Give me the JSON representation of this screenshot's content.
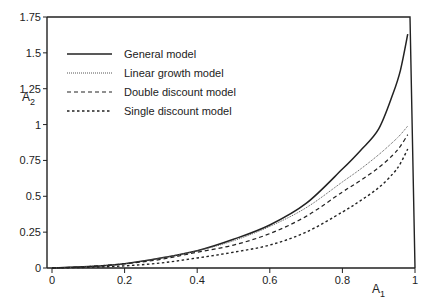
{
  "chart_data": {
    "type": "line",
    "title": "",
    "xlabel": "A1",
    "ylabel": "A2",
    "xlim": [
      0,
      1
    ],
    "ylim": [
      0,
      1.75
    ],
    "grid": false,
    "legend_position": "upper-left",
    "x_ticks": [
      "0",
      "0.2",
      "0.4",
      "0.6",
      "0.8",
      "1"
    ],
    "y_ticks": [
      "0",
      "0.25",
      "0.5",
      "0.75",
      "1",
      "1.25",
      "1.5",
      "1.75"
    ],
    "series": [
      {
        "name": "General model",
        "style": "solid",
        "x": [
          0,
          0.1,
          0.2,
          0.3,
          0.4,
          0.5,
          0.6,
          0.7,
          0.8,
          0.85,
          0.9,
          0.94,
          0.96,
          0.98
        ],
        "values": [
          0,
          0.01,
          0.03,
          0.07,
          0.12,
          0.2,
          0.3,
          0.45,
          0.69,
          0.82,
          0.97,
          1.22,
          1.38,
          1.63
        ]
      },
      {
        "name": "Linear growth model",
        "style": "dotted",
        "x": [
          0,
          0.1,
          0.2,
          0.3,
          0.4,
          0.5,
          0.6,
          0.7,
          0.8,
          0.85,
          0.9,
          0.94,
          0.96,
          0.98
        ],
        "values": [
          0,
          0.01,
          0.03,
          0.07,
          0.12,
          0.19,
          0.29,
          0.42,
          0.6,
          0.69,
          0.79,
          0.88,
          0.93,
          0.99
        ]
      },
      {
        "name": "Double discount model",
        "style": "dashed",
        "x": [
          0,
          0.1,
          0.2,
          0.3,
          0.4,
          0.5,
          0.6,
          0.7,
          0.8,
          0.85,
          0.9,
          0.94,
          0.96,
          0.98
        ],
        "values": [
          0,
          0.01,
          0.03,
          0.06,
          0.11,
          0.16,
          0.24,
          0.36,
          0.53,
          0.61,
          0.7,
          0.79,
          0.85,
          0.93
        ]
      },
      {
        "name": "Single discount model",
        "style": "short-dashed",
        "x": [
          0,
          0.1,
          0.2,
          0.3,
          0.4,
          0.5,
          0.6,
          0.7,
          0.8,
          0.85,
          0.9,
          0.94,
          0.96,
          0.98
        ],
        "values": [
          0,
          0.005,
          0.015,
          0.035,
          0.07,
          0.11,
          0.16,
          0.25,
          0.39,
          0.47,
          0.56,
          0.66,
          0.73,
          0.83
        ]
      }
    ]
  },
  "axes": {
    "x_label_main": "A",
    "x_label_sub": "1",
    "y_label_main": "A",
    "y_label_sub": "2"
  },
  "colors": {
    "line": "#222222",
    "axis": "#222222",
    "background": "#ffffff"
  }
}
